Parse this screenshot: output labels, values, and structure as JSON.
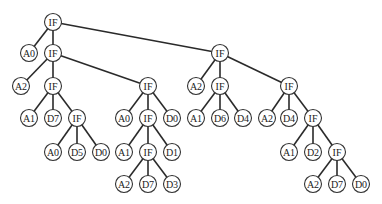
{
  "diagram": {
    "type": "tree",
    "node_radius": 8.5,
    "colors": {
      "edge": "#2a2a2a",
      "node_stroke": "#333333",
      "node_fill": "#ffffff",
      "text": "#222222"
    },
    "nodes": [
      {
        "id": "n0",
        "label": "IF",
        "x": 53,
        "y": 22
      },
      {
        "id": "n1",
        "label": "A0",
        "x": 29,
        "y": 53
      },
      {
        "id": "n2",
        "label": "IF",
        "x": 53,
        "y": 53
      },
      {
        "id": "n3",
        "label": "A2",
        "x": 21,
        "y": 86
      },
      {
        "id": "n4",
        "label": "IF",
        "x": 53,
        "y": 86
      },
      {
        "id": "n5",
        "label": "A1",
        "x": 29,
        "y": 118
      },
      {
        "id": "n6",
        "label": "D7",
        "x": 53,
        "y": 118
      },
      {
        "id": "n7",
        "label": "IF",
        "x": 77,
        "y": 118
      },
      {
        "id": "n8",
        "label": "A0",
        "x": 53,
        "y": 152
      },
      {
        "id": "n9",
        "label": "D5",
        "x": 77,
        "y": 152
      },
      {
        "id": "n10",
        "label": "D0",
        "x": 101,
        "y": 152
      },
      {
        "id": "n11",
        "label": "IF",
        "x": 148,
        "y": 86
      },
      {
        "id": "n12",
        "label": "A0",
        "x": 124,
        "y": 118
      },
      {
        "id": "n13",
        "label": "IF",
        "x": 148,
        "y": 118
      },
      {
        "id": "n14",
        "label": "D0",
        "x": 172,
        "y": 118
      },
      {
        "id": "n15",
        "label": "A1",
        "x": 124,
        "y": 152
      },
      {
        "id": "n16",
        "label": "IF",
        "x": 148,
        "y": 152
      },
      {
        "id": "n17",
        "label": "D1",
        "x": 172,
        "y": 152
      },
      {
        "id": "n18",
        "label": "A2",
        "x": 124,
        "y": 184
      },
      {
        "id": "n19",
        "label": "D7",
        "x": 148,
        "y": 184
      },
      {
        "id": "n20",
        "label": "D3",
        "x": 172,
        "y": 184
      },
      {
        "id": "n21",
        "label": "IF",
        "x": 220,
        "y": 53
      },
      {
        "id": "n22",
        "label": "A2",
        "x": 196,
        "y": 86
      },
      {
        "id": "n23",
        "label": "IF",
        "x": 220,
        "y": 86
      },
      {
        "id": "n24",
        "label": "A1",
        "x": 196,
        "y": 118
      },
      {
        "id": "n25",
        "label": "D6",
        "x": 220,
        "y": 118
      },
      {
        "id": "n26",
        "label": "D4",
        "x": 243,
        "y": 118
      },
      {
        "id": "n27",
        "label": "IF",
        "x": 289,
        "y": 86
      },
      {
        "id": "n28",
        "label": "A2",
        "x": 267,
        "y": 118
      },
      {
        "id": "n29",
        "label": "D4",
        "x": 289,
        "y": 118
      },
      {
        "id": "n30",
        "label": "IF",
        "x": 313,
        "y": 118
      },
      {
        "id": "n31",
        "label": "A1",
        "x": 289,
        "y": 152
      },
      {
        "id": "n32",
        "label": "D2",
        "x": 313,
        "y": 152
      },
      {
        "id": "n33",
        "label": "IF",
        "x": 337,
        "y": 152
      },
      {
        "id": "n34",
        "label": "A2",
        "x": 313,
        "y": 184
      },
      {
        "id": "n35",
        "label": "D7",
        "x": 337,
        "y": 184
      },
      {
        "id": "n36",
        "label": "D0",
        "x": 361,
        "y": 184
      }
    ],
    "edges": [
      [
        "n0",
        "n1"
      ],
      [
        "n0",
        "n2"
      ],
      [
        "n0",
        "n21"
      ],
      [
        "n2",
        "n3"
      ],
      [
        "n2",
        "n4"
      ],
      [
        "n2",
        "n11"
      ],
      [
        "n4",
        "n5"
      ],
      [
        "n4",
        "n6"
      ],
      [
        "n4",
        "n7"
      ],
      [
        "n7",
        "n8"
      ],
      [
        "n7",
        "n9"
      ],
      [
        "n7",
        "n10"
      ],
      [
        "n11",
        "n12"
      ],
      [
        "n11",
        "n13"
      ],
      [
        "n11",
        "n14"
      ],
      [
        "n13",
        "n15"
      ],
      [
        "n13",
        "n16"
      ],
      [
        "n13",
        "n17"
      ],
      [
        "n16",
        "n18"
      ],
      [
        "n16",
        "n19"
      ],
      [
        "n16",
        "n20"
      ],
      [
        "n21",
        "n22"
      ],
      [
        "n21",
        "n23"
      ],
      [
        "n21",
        "n27"
      ],
      [
        "n23",
        "n24"
      ],
      [
        "n23",
        "n25"
      ],
      [
        "n23",
        "n26"
      ],
      [
        "n27",
        "n28"
      ],
      [
        "n27",
        "n29"
      ],
      [
        "n27",
        "n30"
      ],
      [
        "n30",
        "n31"
      ],
      [
        "n30",
        "n32"
      ],
      [
        "n30",
        "n33"
      ],
      [
        "n33",
        "n34"
      ],
      [
        "n33",
        "n35"
      ],
      [
        "n33",
        "n36"
      ]
    ]
  }
}
